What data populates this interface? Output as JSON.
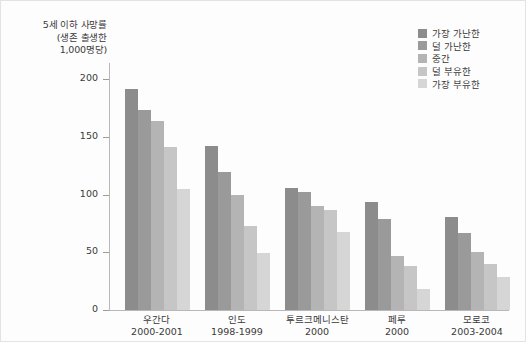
{
  "chart_data": {
    "type": "bar",
    "title": "",
    "subtitle": "",
    "xlabel": "",
    "ylabel": "5세 이하 사망률 (생존 출생한 1,000명당)",
    "ylabel_lines": [
      "5세 이하 사망률",
      "(생존 출생한",
      "1,000명당)"
    ],
    "ylim": [
      0,
      215
    ],
    "yticks": [
      0,
      50,
      100,
      150,
      200
    ],
    "ytick_labels": [
      "0",
      "50",
      "100",
      "150",
      "200"
    ],
    "grid": false,
    "legend_position": "top-right",
    "categories": [
      "우간다",
      "인도",
      "투르크메니스탄",
      "페루",
      "모로코"
    ],
    "category_years": [
      "2000-2001",
      "1998-1999",
      "2000",
      "2000",
      "2003-2004"
    ],
    "series": [
      {
        "name": "가장 가난한",
        "color": "#8c8c8c",
        "values": [
          192,
          142,
          106,
          94,
          81
        ]
      },
      {
        "name": "덜 가난한",
        "color": "#9a9a9a",
        "values": [
          173,
          120,
          102,
          79,
          67
        ]
      },
      {
        "name": "중간",
        "color": "#b4b4b4",
        "values": [
          164,
          100,
          90,
          47,
          50
        ]
      },
      {
        "name": "덜 부유한",
        "color": "#c6c6c6",
        "values": [
          141,
          73,
          87,
          38,
          40
        ]
      },
      {
        "name": "가장 부유한",
        "color": "#d6d6d6",
        "values": [
          105,
          49,
          68,
          18,
          29
        ]
      }
    ]
  },
  "legend": {
    "items": [
      {
        "label": "가장 가난한",
        "color": "#8c8c8c"
      },
      {
        "label": "덜 가난한",
        "color": "#9a9a9a"
      },
      {
        "label": "중간",
        "color": "#b4b4b4"
      },
      {
        "label": "덜 부유한",
        "color": "#c6c6c6"
      },
      {
        "label": "가장 부유한",
        "color": "#d6d6d6"
      }
    ]
  }
}
